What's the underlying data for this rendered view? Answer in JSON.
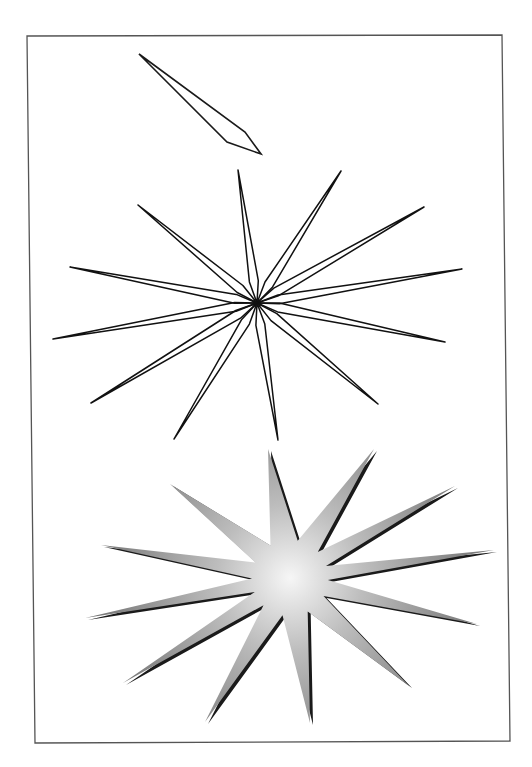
{
  "page": {
    "width": 532,
    "height": 767,
    "background": "#ffffff"
  },
  "frame": {
    "stroke": "#555555",
    "stroke_width": 1.3,
    "corners": [
      [
        27,
        36
      ],
      [
        502,
        35
      ],
      [
        510,
        741
      ],
      [
        35,
        743
      ]
    ]
  },
  "single_spike": {
    "stroke": "#1a1a1a",
    "stroke_width": 1.6,
    "points": [
      [
        139,
        54
      ],
      [
        245,
        132
      ],
      [
        261,
        154
      ],
      [
        227,
        142
      ]
    ]
  },
  "outline_star": {
    "center": [
      257,
      303
    ],
    "stroke": "#111111",
    "stroke_width": 1.5,
    "spike_count": 12,
    "base_offset": 22,
    "half_width": 4.5,
    "tips": [
      [
        238,
        170
      ],
      [
        341,
        171
      ],
      [
        424,
        207
      ],
      [
        462,
        269
      ],
      [
        445,
        342
      ],
      [
        378,
        404
      ],
      [
        278,
        440
      ],
      [
        174,
        439
      ],
      [
        91,
        403
      ],
      [
        53,
        339
      ],
      [
        70,
        267
      ],
      [
        138,
        205
      ]
    ]
  },
  "gradient_star": {
    "center": [
      290,
      578
    ],
    "inner_radius": 38,
    "gradient_center_color": "#f6f6f6",
    "gradient_mid_color": "#bdbdbd",
    "gradient_edge_color": "#6e6e6e",
    "shadow_color": "#1a1a1a",
    "shadow_offset": [
      3,
      2
    ],
    "tips": [
      [
        268,
        449
      ],
      [
        374,
        449
      ],
      [
        455,
        486
      ],
      [
        494,
        550
      ],
      [
        477,
        624
      ],
      [
        409,
        686
      ],
      [
        310,
        723
      ],
      [
        205,
        722
      ],
      [
        123,
        683
      ],
      [
        85,
        618
      ],
      [
        101,
        545
      ],
      [
        170,
        484
      ]
    ]
  }
}
